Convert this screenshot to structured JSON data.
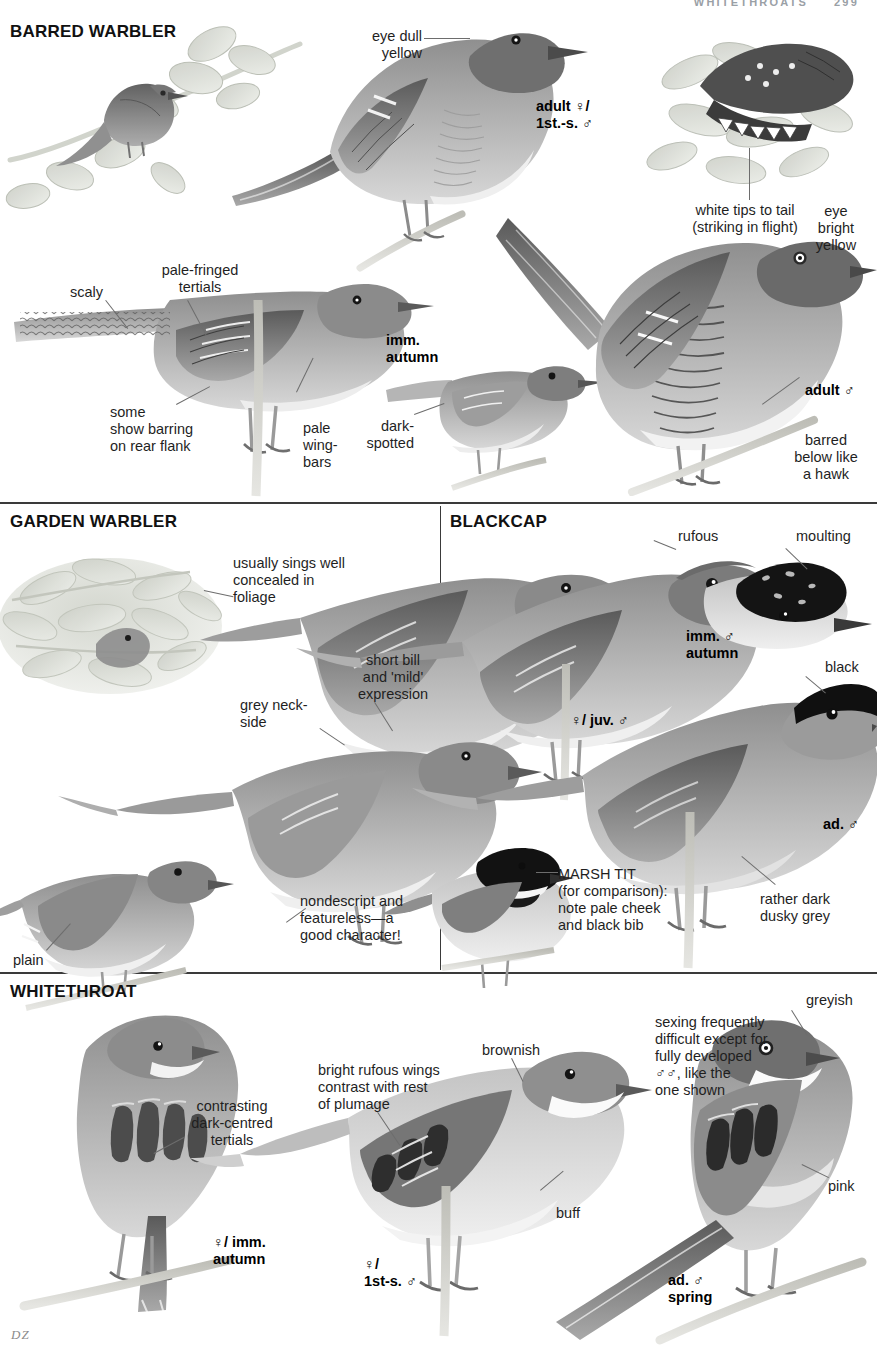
{
  "running_head": {
    "title": "WHITETHROATS",
    "page_number": "299"
  },
  "signature": "DZ",
  "sections": [
    {
      "id": "barred-warbler",
      "title": "BARRED WARBLER",
      "labels": [
        {
          "id": "eye-dull-yellow",
          "text": "eye dull\nyellow"
        },
        {
          "id": "adult-female-1st-s-male",
          "text": "adult ♀/\n1st.-s. ♂",
          "bold": true
        },
        {
          "id": "white-tips-to-tail",
          "text": "white tips to tail\n(striking in flight)"
        },
        {
          "id": "eye-bright-yellow",
          "text": "eye\nbright\nyellow"
        },
        {
          "id": "pale-fringed-tertials",
          "text": "pale-fringed\ntertials"
        },
        {
          "id": "scaly",
          "text": "scaly"
        },
        {
          "id": "imm-autumn",
          "text": "imm.\nautumn",
          "bold": true
        },
        {
          "id": "some-show-barring",
          "text": "some\nshow barring\non rear flank"
        },
        {
          "id": "pale-wing-bars",
          "text": "pale\nwing-\nbars"
        },
        {
          "id": "dark-spotted",
          "text": "dark-\nspotted"
        },
        {
          "id": "adult-male",
          "text": "adult ♂",
          "bold": true
        },
        {
          "id": "barred-below-like-a-hawk",
          "text": "barred\nbelow like\na hawk"
        }
      ]
    },
    {
      "id": "garden-warbler",
      "title": "GARDEN WARBLER",
      "labels": [
        {
          "id": "usually-sings-well-concealed",
          "text": "usually sings well\nconcealed in\nfoliage"
        },
        {
          "id": "short-bill-mild-expression",
          "text": "short bill\nand 'mild'\nexpression"
        },
        {
          "id": "grey-neck-side",
          "text": "grey neck-\nside"
        },
        {
          "id": "nondescript-featureless",
          "text": "nondescript and\nfeatureless—a\ngood character!"
        },
        {
          "id": "plain",
          "text": "plain"
        }
      ]
    },
    {
      "id": "blackcap",
      "title": "BLACKCAP",
      "labels": [
        {
          "id": "rufous",
          "text": "rufous"
        },
        {
          "id": "moulting",
          "text": "moulting"
        },
        {
          "id": "imm-male-autumn",
          "text": "imm. ♂\nautumn",
          "bold": true
        },
        {
          "id": "black",
          "text": "black"
        },
        {
          "id": "female-juv-male",
          "text": "♀/ juv. ♂",
          "bold": true
        },
        {
          "id": "ad-male",
          "text": "ad. ♂",
          "bold": true
        },
        {
          "id": "marsh-tit-comparison",
          "text": "MARSH TIT\n(for comparison):\nnote pale cheek\nand black bib"
        },
        {
          "id": "rather-dark-dusky-grey",
          "text": "rather dark\ndusky grey"
        }
      ]
    },
    {
      "id": "whitethroat",
      "title": "WHITETHROAT",
      "labels": [
        {
          "id": "contrasting-dark-centred-tertials",
          "text": "contrasting\ndark-centred\ntertials"
        },
        {
          "id": "bright-rufous-wings",
          "text": "bright rufous wings\ncontrast with rest\nof plumage"
        },
        {
          "id": "brownish",
          "text": "brownish"
        },
        {
          "id": "greyish",
          "text": "greyish"
        },
        {
          "id": "sexing-frequently-difficult",
          "text": "sexing frequently\ndifficult except for\nfully developed\n♂♂, like the\none shown"
        },
        {
          "id": "buff",
          "text": "buff"
        },
        {
          "id": "pink",
          "text": "pink"
        },
        {
          "id": "female-imm-autumn",
          "text": "♀/ imm.\nautumn",
          "bold": true
        },
        {
          "id": "female-1st-s-male",
          "text": "♀/\n1st-s. ♂",
          "bold": true
        },
        {
          "id": "ad-male-spring",
          "text": "ad. ♂\nspring",
          "bold": true
        }
      ]
    }
  ],
  "colors": {
    "ink": "#1f1f1f",
    "rule": "#3a3a3a",
    "leader": "#6d6d6d",
    "runhead": "#9aa0a6",
    "plumage_dark": "#5d5d5d",
    "plumage_mid": "#8d8d8d",
    "plumage_light": "#c9c9c9",
    "foliage": "#b9bdb4",
    "black_cap": "#141414"
  }
}
